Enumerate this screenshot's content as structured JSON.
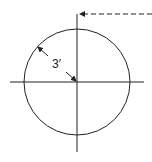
{
  "diagram": {
    "type": "circle-with-radius-dimension",
    "radius_label": "3′",
    "stroke_color": "#222222",
    "background": "#ffffff",
    "elements": {
      "circle": {
        "cx": 77,
        "cy": 82,
        "r": 53
      },
      "vertical_axis": {
        "x": 77,
        "y1": 18,
        "y2": 152
      },
      "horizontal_axis": {
        "y": 82,
        "x1": 10,
        "x2": 144
      },
      "dashed_leader": {
        "y": 14,
        "x1": 79,
        "x2": 152,
        "arrow": "left"
      },
      "radius_dimension": {
        "from": [
          37,
          46
        ],
        "to": [
          77,
          82
        ]
      }
    }
  }
}
